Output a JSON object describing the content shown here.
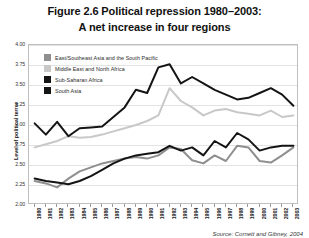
{
  "figure": {
    "title_line1": "Figure 2.6 Political repression 1980–2003:",
    "title_line2": "A net increase in four regions",
    "source": "Source: Cornett and Gibney, 2004"
  },
  "chart_data": {
    "type": "line",
    "title": "Figure 2.6 Political repression 1980–2003: A net increase in four regions",
    "xlabel": "",
    "ylabel": "Level of political terror",
    "grid": true,
    "legend_position": "top-left-inside",
    "ylim": [
      2.0,
      4.0
    ],
    "ytick_labels": [
      "4.00",
      "3.75",
      "3.50",
      "3.25",
      "3.00",
      "2.75",
      "2.50",
      "2.25",
      "2.00"
    ],
    "ytick_values": [
      4.0,
      3.75,
      3.5,
      3.25,
      3.0,
      2.75,
      2.5,
      2.25,
      2.0
    ],
    "categories": [
      "1980",
      "1981",
      "1982",
      "1983",
      "1984",
      "1985",
      "1986",
      "1987",
      "1988",
      "1989",
      "1990",
      "1991",
      "1992",
      "1993",
      "1994",
      "1995",
      "1996",
      "1997",
      "1998",
      "1999",
      "2000",
      "2001",
      "2002",
      "2003"
    ],
    "x": [
      1980,
      1981,
      1982,
      1983,
      1984,
      1985,
      1986,
      1987,
      1988,
      1989,
      1990,
      1991,
      1992,
      1993,
      1994,
      1995,
      1996,
      1997,
      1998,
      1999,
      2000,
      2001,
      2002,
      2003
    ],
    "series": [
      {
        "name": "East/Southeast Asia and the South Pacific",
        "color": "#8f8f8f",
        "values": [
          2.3,
          2.27,
          2.22,
          2.33,
          2.42,
          2.47,
          2.52,
          2.55,
          2.58,
          2.6,
          2.58,
          2.62,
          2.72,
          2.7,
          2.56,
          2.52,
          2.62,
          2.55,
          2.74,
          2.72,
          2.55,
          2.53,
          2.62,
          2.72
        ]
      },
      {
        "name": "Middle East and North Africa",
        "color": "#c8c8c8",
        "values": [
          2.72,
          2.76,
          2.8,
          2.86,
          2.84,
          2.85,
          2.88,
          2.92,
          2.96,
          3.0,
          3.05,
          3.12,
          3.46,
          3.3,
          3.22,
          3.12,
          3.18,
          3.2,
          3.16,
          3.14,
          3.12,
          3.18,
          3.1,
          3.12
        ]
      },
      {
        "name": "Sub-Saharan Africa",
        "color": "#141414",
        "values": [
          2.33,
          2.3,
          2.28,
          2.26,
          2.3,
          2.36,
          2.44,
          2.52,
          2.58,
          2.62,
          2.64,
          2.66,
          2.74,
          2.68,
          2.72,
          2.62,
          2.8,
          2.72,
          2.9,
          2.82,
          2.68,
          2.72,
          2.74,
          2.74
        ]
      },
      {
        "name": "South Asia",
        "color": "#141414",
        "values": [
          3.02,
          2.88,
          3.04,
          2.86,
          2.96,
          2.97,
          2.98,
          3.1,
          3.22,
          3.44,
          3.4,
          3.72,
          3.76,
          3.52,
          3.6,
          3.52,
          3.44,
          3.38,
          3.32,
          3.34,
          3.4,
          3.46,
          3.38,
          3.24
        ]
      }
    ]
  }
}
